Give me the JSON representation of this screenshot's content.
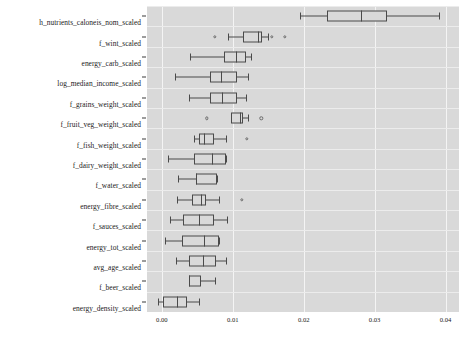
{
  "chart_data": {
    "type": "box",
    "title": "",
    "xlabel": "",
    "ylabel": "",
    "orientation": "horizontal",
    "xlim": [
      -0.0021,
      0.0419
    ],
    "xticks": [
      0.0,
      0.01,
      0.02,
      0.03,
      0.04
    ],
    "xticklabels": [
      "0.00",
      "0.01",
      "0.02",
      "0.03",
      "0.04"
    ],
    "grid": true,
    "legend": "none",
    "background_color": "#d9d9d9",
    "gridline_color": "#f4f4f4",
    "box_edge_color": "#4a4a4a",
    "categories": [
      "h_nutrients_caloneis_nom_scaled",
      "f_wint_scaled",
      "energy_carb_scaled",
      "log_median_income_scaled",
      "f_grains_weight_scaled",
      "f_fruit_veg_weight_scaled",
      "f_fish_weight_scaled",
      "f_dairy_weight_scaled",
      "f_water_scaled",
      "energy_fibre_scaled",
      "f_sauces_scaled",
      "energy_tot_scaled",
      "avg_age_scaled",
      "f_beer_scaled",
      "energy_density_scaled"
    ],
    "boxes": [
      {
        "label": "h_nutrients_caloneis_nom_scaled",
        "whisker_low": 0.0195,
        "q1": 0.0233,
        "median": 0.0281,
        "q3": 0.0317,
        "whisker_high": 0.0391,
        "outliers": []
      },
      {
        "label": "f_wint_scaled",
        "whisker_low": 0.0093,
        "q1": 0.0114,
        "median": 0.0135,
        "q3": 0.0141,
        "whisker_high": 0.0149,
        "outliers": [
          0.0075,
          0.0155,
          0.0173
        ]
      },
      {
        "label": "energy_carb_scaled",
        "whisker_low": 0.0039,
        "q1": 0.0087,
        "median": 0.0105,
        "q3": 0.0118,
        "whisker_high": 0.0126,
        "outliers": []
      },
      {
        "label": "log_median_income_scaled",
        "whisker_low": 0.0018,
        "q1": 0.0068,
        "median": 0.0083,
        "q3": 0.0106,
        "whisker_high": 0.0121,
        "outliers": []
      },
      {
        "label": "f_grains_weight_scaled",
        "whisker_low": 0.0038,
        "q1": 0.0068,
        "median": 0.0085,
        "q3": 0.0106,
        "whisker_high": 0.0119,
        "outliers": []
      },
      {
        "label": "f_fruit_veg_weight_scaled",
        "whisker_low": 0.0098,
        "q1": 0.0098,
        "median": 0.011,
        "q3": 0.0114,
        "whisker_high": 0.0121,
        "outliers": [
          0.0063,
          0.014
        ]
      },
      {
        "label": "f_fish_weight_scaled",
        "whisker_low": 0.0045,
        "q1": 0.0052,
        "median": 0.0059,
        "q3": 0.0073,
        "whisker_high": 0.009,
        "outliers": [
          0.012
        ]
      },
      {
        "label": "f_dairy_weight_scaled",
        "whisker_low": 0.0008,
        "q1": 0.0045,
        "median": 0.007,
        "q3": 0.009,
        "whisker_high": 0.009,
        "outliers": []
      },
      {
        "label": "f_water_scaled",
        "whisker_low": 0.0023,
        "q1": 0.0048,
        "median": 0.0048,
        "q3": 0.0078,
        "whisker_high": 0.0078,
        "outliers": []
      },
      {
        "label": "energy_fibre_scaled",
        "whisker_low": 0.0021,
        "q1": 0.0043,
        "median": 0.0055,
        "q3": 0.0062,
        "whisker_high": 0.008,
        "outliers": [
          0.0113
        ]
      },
      {
        "label": "f_sauces_scaled",
        "whisker_low": 0.0011,
        "q1": 0.003,
        "median": 0.0053,
        "q3": 0.0073,
        "whisker_high": 0.0092,
        "outliers": []
      },
      {
        "label": "energy_tot_scaled",
        "whisker_low": 0.0004,
        "q1": 0.0028,
        "median": 0.006,
        "q3": 0.008,
        "whisker_high": 0.008,
        "outliers": []
      },
      {
        "label": "avg_age_scaled",
        "whisker_low": 0.002,
        "q1": 0.0038,
        "median": 0.0058,
        "q3": 0.0076,
        "whisker_high": 0.009,
        "outliers": []
      },
      {
        "label": "f_beer_scaled",
        "whisker_low": 0.0038,
        "q1": 0.0038,
        "median": 0.0038,
        "q3": 0.0055,
        "whisker_high": 0.0075,
        "outliers": []
      },
      {
        "label": "energy_density_scaled",
        "whisker_low": -0.0005,
        "q1": 0.0001,
        "median": 0.0022,
        "q3": 0.0035,
        "whisker_high": 0.0052,
        "outliers": []
      }
    ]
  }
}
